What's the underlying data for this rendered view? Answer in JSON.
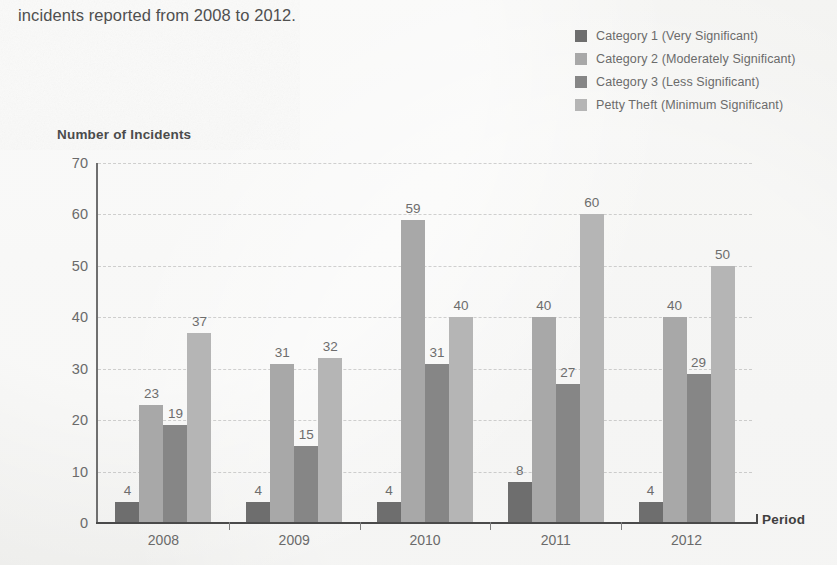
{
  "caption": "incidents reported from 2008 to 2012.",
  "axis_title_x": "Period",
  "axis_title_y": "Number of Incidents",
  "legend": [
    {
      "label": "Category 1 (Very Significant)",
      "color": "#6e6e6e"
    },
    {
      "label": "Category 2 (Moderately Significant)",
      "color": "#a8a8a8"
    },
    {
      "label": "Category 3 (Less Significant)",
      "color": "#868686"
    },
    {
      "label": "Petty Theft (Minimum Significant)",
      "color": "#b5b5b5"
    }
  ],
  "chart_data": {
    "type": "bar",
    "title": "",
    "xlabel": "Period",
    "ylabel": "Number of Incidents",
    "categories": [
      "2008",
      "2009",
      "2010",
      "2011",
      "2012"
    ],
    "ylim": [
      0,
      70
    ],
    "yticks": [
      0,
      10,
      20,
      30,
      40,
      50,
      60,
      70
    ],
    "grid": true,
    "legend_position": "top-right",
    "data_labels": true,
    "series": [
      {
        "name": "Category 1 (Very Significant)",
        "color": "#6e6e6e",
        "values": [
          4,
          4,
          4,
          8,
          4
        ]
      },
      {
        "name": "Category 2 (Moderately Significant)",
        "color": "#a8a8a8",
        "values": [
          23,
          31,
          59,
          40,
          40
        ]
      },
      {
        "name": "Category 3 (Less Significant)",
        "color": "#868686",
        "values": [
          19,
          15,
          31,
          27,
          29
        ]
      },
      {
        "name": "Petty Theft (Minimum Significant)",
        "color": "#b5b5b5",
        "values": [
          37,
          32,
          40,
          60,
          50
        ]
      }
    ]
  }
}
